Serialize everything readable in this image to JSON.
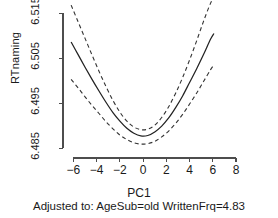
{
  "chart_data": {
    "type": "line",
    "title": "",
    "xlabel": "PC1",
    "ylabel": "RTnaming",
    "subtitle": "Adjusted to: AgeSub=old WrittenFrq=4.83",
    "xlim": [
      -6.9,
      8.6
    ],
    "ylim": [
      6.4828,
      6.5175
    ],
    "grid": false,
    "legend": "none",
    "xticks": [
      -6,
      -4,
      -2,
      0,
      2,
      4,
      6,
      8
    ],
    "xtick_labels": [
      "−6",
      "−4",
      "−2",
      "0",
      "2",
      "4",
      "6",
      "8"
    ],
    "yticks": [
      6.485,
      6.495,
      6.505,
      6.515
    ],
    "ytick_labels": [
      "6.485",
      "6.495",
      "6.505",
      "6.515"
    ],
    "series": [
      {
        "name": "fitted effect",
        "style": "solid",
        "x": [
          -6.2,
          -5.6,
          -5.0,
          -4.4,
          -3.8,
          -3.2,
          -2.6,
          -2.0,
          -1.4,
          -0.8,
          -0.2,
          0.4,
          1.0,
          1.6,
          2.2,
          2.8,
          3.4,
          4.0,
          4.6,
          5.2,
          5.8,
          6.1
        ],
        "y": [
          6.5086,
          6.5058,
          6.503,
          6.5003,
          6.4977,
          6.4952,
          6.4929,
          6.491,
          6.4894,
          6.4883,
          6.4877,
          6.4878,
          6.4886,
          6.4899,
          6.4917,
          6.494,
          6.4966,
          6.4996,
          6.5026,
          6.5058,
          6.5092,
          6.5105
        ]
      },
      {
        "name": "upper confidence band",
        "style": "dashed",
        "x": [
          -6.2,
          -5.6,
          -5.0,
          -4.4,
          -3.8,
          -3.2,
          -2.6,
          -2.0,
          -1.4,
          -0.8,
          -0.2,
          0.4,
          1.0,
          1.6,
          2.2,
          2.8,
          3.4,
          4.0,
          4.6,
          5.2,
          5.8,
          6.1
        ],
        "y": [
          6.5168,
          6.5131,
          6.5094,
          6.5057,
          6.5021,
          6.4987,
          6.4956,
          6.493,
          6.491,
          6.4897,
          6.4891,
          6.4892,
          6.4901,
          6.4918,
          6.4942,
          6.4972,
          6.5007,
          6.5046,
          6.5088,
          6.5132,
          6.5172,
          6.5185
        ]
      },
      {
        "name": "lower confidence band",
        "style": "dashed",
        "x": [
          -6.2,
          -5.6,
          -5.0,
          -4.4,
          -3.8,
          -3.2,
          -2.6,
          -2.0,
          -1.4,
          -0.8,
          -0.2,
          0.4,
          1.0,
          1.6,
          2.2,
          2.8,
          3.4,
          4.0,
          4.6,
          5.2,
          5.8,
          6.1
        ],
        "y": [
          6.5003,
          6.4984,
          6.4964,
          6.4945,
          6.4927,
          6.4909,
          6.4893,
          6.4879,
          6.4869,
          6.4862,
          6.4859,
          6.486,
          6.4865,
          6.4875,
          6.4888,
          6.4905,
          6.4925,
          6.4948,
          6.4972,
          6.4998,
          6.5024,
          6.5035
        ]
      }
    ]
  }
}
